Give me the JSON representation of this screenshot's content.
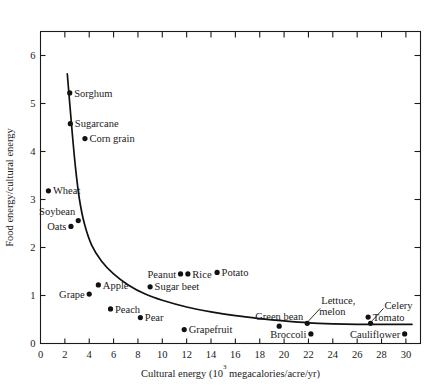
{
  "chart_data": {
    "type": "scatter",
    "title": "",
    "xlabel": "Cultural energy (10³ megacalories/acre/yr)",
    "xlabel_prefix": "Cultural energy (10",
    "xlabel_sup": "3",
    "xlabel_suffix": " megacalories/acre/yr)",
    "ylabel": "Food energy/cultural energy",
    "xlim": [
      0,
      31.2
    ],
    "ylim": [
      0,
      6.5
    ],
    "xticks": [
      0,
      2,
      4,
      6,
      8,
      10,
      12,
      14,
      16,
      18,
      20,
      22,
      24,
      26,
      28,
      30
    ],
    "xticklabels": [
      "0",
      "2",
      "4",
      "6",
      "8",
      "10",
      "12",
      "14",
      "16",
      "18",
      "20",
      "22",
      "24",
      "26",
      "28",
      "30"
    ],
    "yticks": [
      0,
      1,
      2,
      3,
      4,
      5,
      6
    ],
    "yticklabels": [
      "0",
      "1",
      "2",
      "3",
      "4",
      "5",
      "6"
    ],
    "grid": false,
    "legend": false,
    "frame": "box-all-sides-ticks",
    "points": [
      {
        "label": "Sorghum",
        "x": 2.4,
        "y": 5.22,
        "label_side": "right"
      },
      {
        "label": "Sugarcane",
        "x": 2.45,
        "y": 4.58,
        "label_side": "right"
      },
      {
        "label": "Corn grain",
        "x": 3.65,
        "y": 4.27,
        "label_side": "right"
      },
      {
        "label": "Wheat",
        "x": 0.65,
        "y": 3.18,
        "label_side": "right"
      },
      {
        "label": "Soybean",
        "x": 3.1,
        "y": 2.56,
        "label_side": "above-left"
      },
      {
        "label": "Oats",
        "x": 2.5,
        "y": 2.44,
        "label_side": "left"
      },
      {
        "label": "Apple",
        "x": 4.75,
        "y": 1.22,
        "label_side": "right"
      },
      {
        "label": "Grape",
        "x": 4.0,
        "y": 1.03,
        "label_side": "left"
      },
      {
        "label": "Peach",
        "x": 5.75,
        "y": 0.72,
        "label_side": "right"
      },
      {
        "label": "Pear",
        "x": 8.2,
        "y": 0.54,
        "label_side": "right"
      },
      {
        "label": "Sugar beet",
        "x": 9.0,
        "y": 1.18,
        "label_side": "right"
      },
      {
        "label": "Peanut",
        "x": 11.5,
        "y": 1.45,
        "label_side": "left"
      },
      {
        "label": "Rice",
        "x": 12.1,
        "y": 1.45,
        "label_side": "right"
      },
      {
        "label": "Potato",
        "x": 14.5,
        "y": 1.48,
        "label_side": "right"
      },
      {
        "label": "Grapefruit",
        "x": 11.8,
        "y": 0.29,
        "label_side": "right"
      },
      {
        "label": "Green bean",
        "x": 19.6,
        "y": 0.36,
        "label_side": "above"
      },
      {
        "label": "Lettuce, melon",
        "x": 21.9,
        "y": 0.42,
        "label_side": "leader-up-right"
      },
      {
        "label": "Broccoli",
        "x": 22.2,
        "y": 0.2,
        "label_side": "left"
      },
      {
        "label": "Tomato",
        "x": 26.9,
        "y": 0.55,
        "label_side": "right"
      },
      {
        "label": "Celery",
        "x": 27.1,
        "y": 0.42,
        "label_side": "leader-up-right"
      },
      {
        "label": "Cauliflower",
        "x": 29.9,
        "y": 0.2,
        "label_side": "left"
      }
    ],
    "curve_description": "Hyperbolic decay curve of food energy ratio versus cultural energy",
    "curve_points": [
      {
        "x": 2.2,
        "y": 5.62
      },
      {
        "x": 2.6,
        "y": 4.4
      },
      {
        "x": 2.9,
        "y": 3.6
      },
      {
        "x": 3.2,
        "y": 3.0
      },
      {
        "x": 3.6,
        "y": 2.5
      },
      {
        "x": 4.2,
        "y": 2.05
      },
      {
        "x": 5.0,
        "y": 1.72
      },
      {
        "x": 6.0,
        "y": 1.45
      },
      {
        "x": 7.2,
        "y": 1.22
      },
      {
        "x": 8.6,
        "y": 1.03
      },
      {
        "x": 10.0,
        "y": 0.9
      },
      {
        "x": 12.0,
        "y": 0.76
      },
      {
        "x": 14.0,
        "y": 0.66
      },
      {
        "x": 16.0,
        "y": 0.58
      },
      {
        "x": 18.0,
        "y": 0.52
      },
      {
        "x": 20.0,
        "y": 0.47
      },
      {
        "x": 22.0,
        "y": 0.43
      },
      {
        "x": 24.0,
        "y": 0.41
      },
      {
        "x": 26.0,
        "y": 0.4
      },
      {
        "x": 28.0,
        "y": 0.4
      },
      {
        "x": 30.5,
        "y": 0.4
      }
    ]
  }
}
